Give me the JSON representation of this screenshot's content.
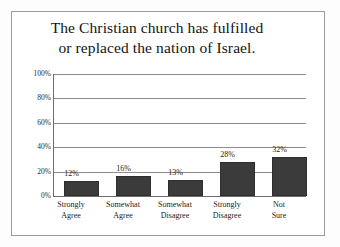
{
  "chart_data": {
    "type": "bar",
    "title": "The Christian church has fulfilled or replaced the nation of Israel.",
    "title_lines": [
      "The Christian church has fulfilled",
      "or replaced the nation of Israel."
    ],
    "categories": [
      "Strongly Agree",
      "Somewhat Agree",
      "Somewhat Disagree",
      "Strongly Disagree",
      "Not Sure"
    ],
    "category_lines": [
      [
        "Strongly",
        "Agree"
      ],
      [
        "Somewhat",
        "Agree"
      ],
      [
        "Somewhat",
        "Disagree"
      ],
      [
        "Strongly",
        "Disagree"
      ],
      [
        "Not",
        "Sure"
      ]
    ],
    "values": [
      12,
      16,
      13,
      28,
      32
    ],
    "value_labels": [
      "12%",
      "16%",
      "13%",
      "28%",
      "32%"
    ],
    "xlabel": "",
    "ylabel": "",
    "ylim": [
      0,
      100
    ],
    "ytick_values": [
      100,
      80,
      60,
      40,
      20,
      0
    ],
    "ytick_labels": [
      "100%",
      "80%",
      "60%",
      "40%",
      "20%",
      "0%"
    ],
    "grid": true,
    "legend": false,
    "legend_position": "none",
    "units": "percent",
    "bar_color": "#3b3b3b",
    "gridline_color": "#8d8d8d",
    "axis_color": "#6e6e6e",
    "border_color": "#9a9a9a",
    "background_color": "#ffffff"
  }
}
